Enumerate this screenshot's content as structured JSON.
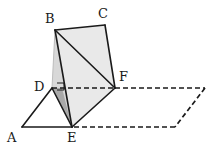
{
  "figure": {
    "type": "geometry-diagram",
    "canvas": {
      "width": 217,
      "height": 154
    },
    "colors": {
      "stroke": "#1a1a1a",
      "light_fill": "#e9e9e9",
      "mid_fill": "#d8d8d8",
      "dark_fill": "#a9a9a9",
      "faint_stroke": "#bdbdbd",
      "background": "#ffffff"
    },
    "stroke_widths": {
      "solid": 1.6,
      "dashed": 1.7,
      "faint": 1.0,
      "right_angle": 1.0
    },
    "dash_pattern": "5,3"
  },
  "vertices": [
    {
      "id": "A",
      "label": "A",
      "x": 22,
      "y": 127,
      "label_x": 7,
      "label_y": 131
    },
    {
      "id": "B",
      "label": "B",
      "x": 55,
      "y": 30,
      "label_x": 45,
      "label_y": 12
    },
    {
      "id": "C",
      "label": "C",
      "x": 105,
      "y": 25,
      "label_x": 98,
      "label_y": 7
    },
    {
      "id": "D",
      "label": "D",
      "x": 52,
      "y": 88,
      "label_x": 34,
      "label_y": 80
    },
    {
      "id": "E",
      "label": "E",
      "x": 72,
      "y": 127,
      "label_x": 67,
      "label_y": 131
    },
    {
      "id": "F",
      "label": "F",
      "x": 115,
      "y": 88,
      "label_x": 119,
      "label_y": 70
    },
    {
      "id": "P1",
      "label": "",
      "x": 205,
      "y": 88,
      "label_x": 0,
      "label_y": 0
    },
    {
      "id": "P2",
      "label": "",
      "x": 175,
      "y": 127,
      "label_x": 0,
      "label_y": 0
    }
  ],
  "faces": [
    {
      "name": "face-b-c-f-e",
      "points": "55,30 105,25 115,88 72,127",
      "fill": "#e9e9e9",
      "note": "upper folded quadrilateral BCFE shaded light"
    },
    {
      "name": "face-d-e-b",
      "points": "52,88 72,127 55,30",
      "fill": "#d8d8d8",
      "note": "narrow vertical sliver between D-E and B"
    },
    {
      "name": "face-d-e-shadow",
      "points": "52,88 72,127 62,88",
      "fill": "#a9a9a9",
      "note": "dark small triangle at D"
    },
    {
      "name": "face-d-f-e",
      "points": "52,88 115,88 72,127",
      "fill": "#e9e9e9",
      "note": "lower triangle DFE below the dashed fold line"
    }
  ],
  "edges": [
    {
      "name": "edge-b-c",
      "from": "B",
      "to": "C",
      "style": "solid"
    },
    {
      "name": "edge-c-f",
      "from": "C",
      "to": "F",
      "style": "solid"
    },
    {
      "name": "edge-b-f",
      "from": "B",
      "to": "F",
      "style": "solid"
    },
    {
      "name": "edge-b-e",
      "from": "B",
      "to": "E",
      "style": "solid"
    },
    {
      "name": "edge-e-f",
      "from": "E",
      "to": "F",
      "style": "solid"
    },
    {
      "name": "edge-a-d",
      "from": "A",
      "to": "D",
      "style": "solid"
    },
    {
      "name": "edge-a-e",
      "from": "A",
      "to": "E",
      "style": "solid"
    },
    {
      "name": "edge-d-e",
      "from": "D",
      "to": "E",
      "style": "solid"
    },
    {
      "name": "edge-b-d",
      "from": "B",
      "to": "D",
      "style": "faint"
    },
    {
      "name": "edge-d-f",
      "from": "D",
      "to": "F",
      "style": "dashed"
    },
    {
      "name": "edge-f-p1",
      "from": "F",
      "to": "P1",
      "style": "dashed"
    },
    {
      "name": "edge-p1-p2",
      "from": "P1",
      "to": "P2",
      "style": "dashed"
    },
    {
      "name": "edge-p2-e",
      "from": "P2",
      "to": "E",
      "style": "dashed"
    }
  ],
  "markers": [
    {
      "name": "right-angle-marker-d",
      "type": "right-angle",
      "at": "D",
      "points": "57,83 64,83 64,90 57,90",
      "note": "small square indicating perpendicularity at D"
    }
  ],
  "labels": {
    "A": "A",
    "B": "B",
    "C": "C",
    "D": "D",
    "E": "E",
    "F": "F"
  }
}
